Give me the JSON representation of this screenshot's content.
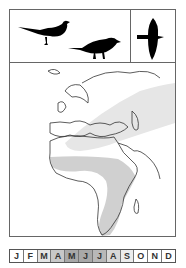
{
  "header": {
    "icons": [
      "perched-bird-tail-up-icon",
      "perched-bird-icon",
      "flying-bird-icon"
    ]
  },
  "map": {
    "regions": [
      "breeding-range-europe-asia",
      "wintering-range-africa"
    ],
    "range_color": "#d8d8d8"
  },
  "months": [
    {
      "label": "J",
      "shade": "#ffffff"
    },
    {
      "label": "F",
      "shade": "#ffffff"
    },
    {
      "label": "M",
      "shade": "#e4e4e4"
    },
    {
      "label": "A",
      "shade": "#c8c8c8"
    },
    {
      "label": "M",
      "shade": "#a8a8a8"
    },
    {
      "label": "J",
      "shade": "#a8a8a8"
    },
    {
      "label": "J",
      "shade": "#b8b8b8"
    },
    {
      "label": "A",
      "shade": "#d8d8d8"
    },
    {
      "label": "S",
      "shade": "#ececec"
    },
    {
      "label": "O",
      "shade": "#ffffff"
    },
    {
      "label": "N",
      "shade": "#ffffff"
    },
    {
      "label": "D",
      "shade": "#ffffff"
    }
  ]
}
